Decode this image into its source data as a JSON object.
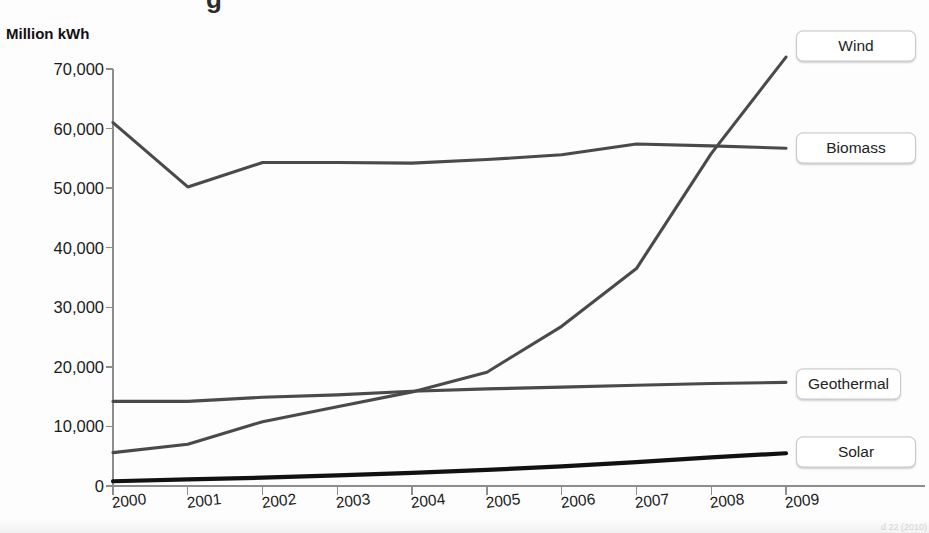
{
  "figure": {
    "title_sliver": "g",
    "source_note": "d 22 (2010)"
  },
  "axes": {
    "y_axis_title": "Million kWh",
    "y_ticks": [
      "0",
      "10,000",
      "20,000",
      "30,000",
      "40,000",
      "50,000",
      "60,000",
      "70,000"
    ],
    "x_ticks": [
      "2000",
      "2001",
      "2002",
      "2003",
      "2004",
      "2005",
      "2006",
      "2007",
      "2008",
      "2009"
    ]
  },
  "callouts": [
    {
      "label": "Wind"
    },
    {
      "label": "Biomass"
    },
    {
      "label": "Geothermal"
    },
    {
      "label": "Solar"
    }
  ],
  "colors": {
    "line_gray": "#4a4a4a",
    "line_black": "#111111",
    "axis": "#8d8d8d",
    "text": "#1b1b1b",
    "callout_border": "#c9c9c9",
    "background": "#fdfdfd"
  },
  "chart_data": {
    "type": "line",
    "title": "",
    "xlabel": "",
    "ylabel": "Million kWh",
    "x": [
      2000,
      2001,
      2002,
      2003,
      2004,
      2005,
      2006,
      2007,
      2008,
      2009
    ],
    "xlim": [
      2000,
      2009
    ],
    "ylim": [
      0,
      70000
    ],
    "ytick_values": [
      0,
      10000,
      20000,
      30000,
      40000,
      50000,
      60000,
      70000
    ],
    "grid": false,
    "legend": "direct-labels-right",
    "series": [
      {
        "name": "Biomass",
        "color": "#4a4a4a",
        "values": [
          61000,
          50200,
          54300,
          54300,
          54200,
          55000,
          55800,
          57400,
          57100,
          56700
        ]
      },
      {
        "name": "Wind",
        "color": "#4a4a4a",
        "values": [
          5600,
          6800,
          10400,
          11200,
          14100,
          17800,
          26600,
          34500,
          55400,
          70800
        ]
      },
      {
        "name": "Geothermal",
        "color": "#4a4a4a",
        "values": [
          14200,
          14200,
          14500,
          14400,
          14800,
          14700,
          14600,
          14600,
          14800,
          15000
        ]
      },
      {
        "name": "Solar",
        "color": "#111111",
        "values": [
          500,
          550,
          550,
          550,
          580,
          550,
          510,
          610,
          860,
          890
        ]
      }
    ],
    "series_plotted_points": {
      "Biomass": [
        [
          2000,
          61000
        ],
        [
          2001,
          50200
        ],
        [
          2002,
          54300
        ],
        [
          2003,
          54300
        ],
        [
          2004,
          54200
        ],
        [
          2005,
          54800
        ],
        [
          2006,
          55600
        ],
        [
          2007,
          57400
        ],
        [
          2008,
          57100
        ],
        [
          2009,
          56700
        ]
      ],
      "Wind": [
        [
          2000,
          5600
        ],
        [
          2001,
          7000
        ],
        [
          2002,
          10800
        ],
        [
          2003,
          13300
        ],
        [
          2004,
          15800
        ],
        [
          2005,
          19100
        ],
        [
          2006,
          26800
        ],
        [
          2007,
          36500
        ],
        [
          2008,
          55800
        ],
        [
          2009,
          72000
        ]
      ],
      "Geothermal": [
        [
          2000,
          14200
        ],
        [
          2001,
          14200
        ],
        [
          2002,
          14900
        ],
        [
          2003,
          15300
        ],
        [
          2004,
          15900
        ],
        [
          2005,
          16300
        ],
        [
          2006,
          16600
        ],
        [
          2007,
          16900
        ],
        [
          2008,
          17200
        ],
        [
          2009,
          17400
        ]
      ],
      "Solar": [
        [
          2000,
          800
        ],
        [
          2001,
          1100
        ],
        [
          2002,
          1400
        ],
        [
          2003,
          1800
        ],
        [
          2004,
          2200
        ],
        [
          2005,
          2700
        ],
        [
          2006,
          3300
        ],
        [
          2007,
          4000
        ],
        [
          2008,
          4800
        ],
        [
          2009,
          5500
        ]
      ]
    }
  }
}
